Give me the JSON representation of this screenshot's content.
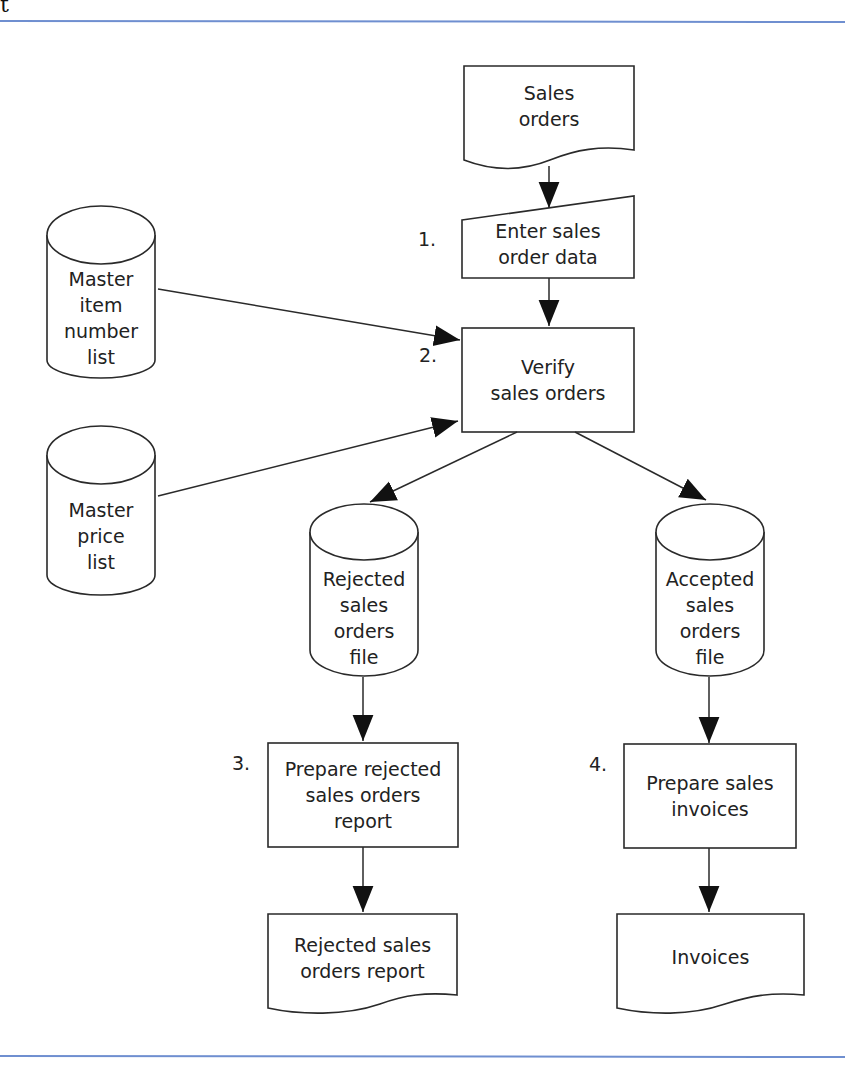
{
  "page": {
    "header_fragment": "t",
    "rule_color": "#6f8fd0"
  },
  "flowchart": {
    "inputs": {
      "sales_orders": "Sales\norders",
      "master_item_list": "Master\nitem\nnumber\nlist",
      "master_price_list": "Master\nprice\nlist"
    },
    "steps": [
      {
        "number": "1.",
        "label": "Enter sales\norder data",
        "type": "manual-input"
      },
      {
        "number": "2.",
        "label": "Verify\nsales orders",
        "type": "process"
      },
      {
        "number": "3.",
        "label": "Prepare rejected\nsales orders\nreport",
        "type": "process"
      },
      {
        "number": "4.",
        "label": "Prepare sales\ninvoices",
        "type": "process"
      }
    ],
    "files": {
      "rejected": "Rejected\nsales\norders\nfile",
      "accepted": "Accepted\nsales\norders\nfile"
    },
    "outputs": {
      "rejected_report": "Rejected sales\norders report",
      "invoices": "Invoices"
    }
  }
}
